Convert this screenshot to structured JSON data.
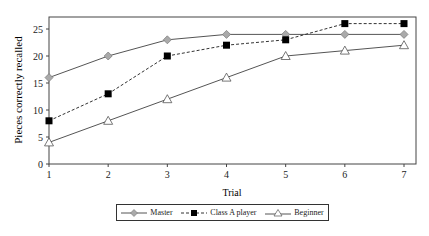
{
  "chart_data": {
    "type": "line",
    "title": "",
    "xlabel": "Trial",
    "ylabel": "Pieces correctly recalled",
    "x": [
      1,
      2,
      3,
      4,
      5,
      6,
      7
    ],
    "xticks": [
      "1",
      "2",
      "3",
      "4",
      "5",
      "6",
      "7"
    ],
    "yticks": [
      "0",
      "5",
      "10",
      "15",
      "20",
      "25"
    ],
    "ylim": [
      0,
      27
    ],
    "xlim": [
      1,
      7.3
    ],
    "grid": false,
    "legend_position": "bottom",
    "series": [
      {
        "name": "Master",
        "values": [
          16,
          20,
          23,
          24,
          24,
          24,
          24
        ],
        "marker": "diamond",
        "line": "solid",
        "color": "#999999"
      },
      {
        "name": "Class A player",
        "values": [
          8,
          13,
          20,
          22,
          23,
          26,
          26
        ],
        "marker": "square",
        "line": "dashed",
        "color": "#000000"
      },
      {
        "name": "Beginner",
        "values": [
          4,
          8,
          12,
          16,
          20,
          21,
          22
        ],
        "marker": "triangle",
        "line": "solid",
        "color": "#ffffff"
      }
    ]
  },
  "legend": {
    "items": [
      {
        "label": "Master"
      },
      {
        "label": "Class A player"
      },
      {
        "label": "Beginner"
      }
    ]
  }
}
